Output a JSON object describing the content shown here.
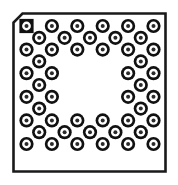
{
  "figure": {
    "name": "bga-package-outline-drawing",
    "width": 178,
    "height": 185,
    "background_color": "#ffffff"
  },
  "package": {
    "type": "BGA",
    "view": "bottom",
    "outline": {
      "x": 13.5,
      "y": 13.5,
      "width": 152,
      "height": 158,
      "stroke_color": "#1a1a1a",
      "stroke_width": 2.6,
      "fill_color": "#ffffff",
      "chamfer_corner": "top-left",
      "chamfer_size": 9
    },
    "ball_style": {
      "outer_radius": 7.1,
      "outer_color": "#111111",
      "ring_radius": 4.4,
      "ring_color": "#ffffff",
      "inner_radius": 2.0,
      "inner_color": "#2b2b2b",
      "pin1_shape": "square",
      "pin1_half_size": 7.1
    },
    "grid": {
      "arrangement": "staggered-interstitial",
      "origin_x": 26.5,
      "origin_y": 26.0,
      "pitch_x": 25.4,
      "pitch_y": 23.6,
      "columns": 6,
      "rows": 7,
      "peripheral_depth": 3,
      "hollow_center": true
    },
    "pin1_indicator": {
      "label": "pin-1-marker",
      "row": 0,
      "col": 0,
      "shape": "square"
    },
    "balls": [
      {
        "id": "A1",
        "cx": 26.5,
        "cy": 26.0,
        "shape": "square"
      },
      {
        "id": "A2",
        "cx": 51.9,
        "cy": 26.0,
        "shape": "circle"
      },
      {
        "id": "A3",
        "cx": 77.3,
        "cy": 26.0,
        "shape": "circle"
      },
      {
        "id": "A4",
        "cx": 102.7,
        "cy": 26.0,
        "shape": "circle"
      },
      {
        "id": "A5",
        "cx": 128.1,
        "cy": 26.0,
        "shape": "circle"
      },
      {
        "id": "A6",
        "cx": 153.5,
        "cy": 26.0,
        "shape": "circle"
      },
      {
        "id": "B1",
        "cx": 39.2,
        "cy": 37.8,
        "shape": "circle"
      },
      {
        "id": "B2",
        "cx": 64.6,
        "cy": 37.8,
        "shape": "circle"
      },
      {
        "id": "B3",
        "cx": 90.0,
        "cy": 37.8,
        "shape": "circle"
      },
      {
        "id": "B4",
        "cx": 115.4,
        "cy": 37.8,
        "shape": "circle"
      },
      {
        "id": "B5",
        "cx": 140.8,
        "cy": 37.8,
        "shape": "circle"
      },
      {
        "id": "C1",
        "cx": 26.5,
        "cy": 49.6,
        "shape": "circle"
      },
      {
        "id": "C2",
        "cx": 51.9,
        "cy": 49.6,
        "shape": "circle"
      },
      {
        "id": "C3",
        "cx": 77.3,
        "cy": 49.6,
        "shape": "circle"
      },
      {
        "id": "C4",
        "cx": 102.7,
        "cy": 49.6,
        "shape": "circle"
      },
      {
        "id": "C5",
        "cx": 128.1,
        "cy": 49.6,
        "shape": "circle"
      },
      {
        "id": "C6",
        "cx": 153.5,
        "cy": 49.6,
        "shape": "circle"
      },
      {
        "id": "D1",
        "cx": 39.2,
        "cy": 61.4,
        "shape": "circle"
      },
      {
        "id": "D5",
        "cx": 140.8,
        "cy": 61.4,
        "shape": "circle"
      },
      {
        "id": "E1",
        "cx": 26.5,
        "cy": 73.2,
        "shape": "circle"
      },
      {
        "id": "E2",
        "cx": 51.9,
        "cy": 73.2,
        "shape": "circle"
      },
      {
        "id": "E5",
        "cx": 128.1,
        "cy": 73.2,
        "shape": "circle"
      },
      {
        "id": "E6",
        "cx": 153.5,
        "cy": 73.2,
        "shape": "circle"
      },
      {
        "id": "F1",
        "cx": 39.2,
        "cy": 85.0,
        "shape": "circle"
      },
      {
        "id": "F5",
        "cx": 140.8,
        "cy": 85.0,
        "shape": "circle"
      },
      {
        "id": "G1",
        "cx": 26.5,
        "cy": 96.8,
        "shape": "circle"
      },
      {
        "id": "G2",
        "cx": 51.9,
        "cy": 96.8,
        "shape": "circle"
      },
      {
        "id": "G5",
        "cx": 128.1,
        "cy": 96.8,
        "shape": "circle"
      },
      {
        "id": "G6",
        "cx": 153.5,
        "cy": 96.8,
        "shape": "circle"
      },
      {
        "id": "H1",
        "cx": 39.2,
        "cy": 108.6,
        "shape": "circle"
      },
      {
        "id": "H5",
        "cx": 140.8,
        "cy": 108.6,
        "shape": "circle"
      },
      {
        "id": "J1",
        "cx": 26.5,
        "cy": 120.4,
        "shape": "circle"
      },
      {
        "id": "J2",
        "cx": 51.9,
        "cy": 120.4,
        "shape": "circle"
      },
      {
        "id": "J3",
        "cx": 77.3,
        "cy": 120.4,
        "shape": "circle"
      },
      {
        "id": "J4",
        "cx": 102.7,
        "cy": 120.4,
        "shape": "circle"
      },
      {
        "id": "J5",
        "cx": 128.1,
        "cy": 120.4,
        "shape": "circle"
      },
      {
        "id": "J6",
        "cx": 153.5,
        "cy": 120.4,
        "shape": "circle"
      },
      {
        "id": "K1",
        "cx": 39.2,
        "cy": 132.2,
        "shape": "circle"
      },
      {
        "id": "K2",
        "cx": 64.6,
        "cy": 132.2,
        "shape": "circle"
      },
      {
        "id": "K3",
        "cx": 90.0,
        "cy": 132.2,
        "shape": "circle"
      },
      {
        "id": "K4",
        "cx": 115.4,
        "cy": 132.2,
        "shape": "circle"
      },
      {
        "id": "K5",
        "cx": 140.8,
        "cy": 132.2,
        "shape": "circle"
      },
      {
        "id": "L1",
        "cx": 26.5,
        "cy": 144.0,
        "shape": "circle"
      },
      {
        "id": "L2",
        "cx": 51.9,
        "cy": 144.0,
        "shape": "circle"
      },
      {
        "id": "L3",
        "cx": 77.3,
        "cy": 144.0,
        "shape": "circle"
      },
      {
        "id": "L4",
        "cx": 102.7,
        "cy": 144.0,
        "shape": "circle"
      },
      {
        "id": "L5",
        "cx": 128.1,
        "cy": 144.0,
        "shape": "circle"
      },
      {
        "id": "L6",
        "cx": 153.5,
        "cy": 144.0,
        "shape": "circle"
      }
    ]
  }
}
